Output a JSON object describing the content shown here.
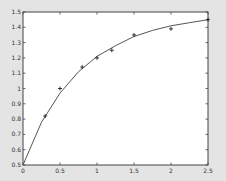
{
  "chart_data": {
    "type": "line",
    "title": "",
    "xlabel": "",
    "ylabel": "",
    "xlim": [
      0,
      2.5
    ],
    "ylim": [
      0.5,
      1.5
    ],
    "grid": false,
    "legend": null,
    "x_ticks": [
      0,
      0.5,
      1,
      1.5,
      2,
      2.5
    ],
    "x_tick_labels": [
      "0",
      "0.5",
      "1",
      "1.5",
      "2",
      "2.5"
    ],
    "y_ticks": [
      0.5,
      0.6,
      0.7,
      0.8,
      0.9,
      1.0,
      1.1,
      1.2,
      1.3,
      1.4,
      1.5
    ],
    "y_tick_labels": [
      "0.5",
      "0.6",
      "0.7",
      "0.8",
      "0.9",
      "1",
      "1.1",
      "1.2",
      "1.3",
      "1.4",
      "1.5"
    ],
    "series": [
      {
        "name": "data",
        "style": "markers",
        "marker": "+",
        "x": [
          0.3,
          0.5,
          0.8,
          1.0,
          1.2,
          1.5,
          2.0,
          2.5
        ],
        "y": [
          0.82,
          1.0,
          1.14,
          1.2,
          1.25,
          1.35,
          1.39,
          1.45
        ]
      },
      {
        "name": "fit",
        "style": "line",
        "x": [
          0,
          0.25,
          0.5,
          0.75,
          1.0,
          1.25,
          1.5,
          1.75,
          2.0,
          2.25,
          2.5
        ],
        "y": [
          0.5,
          0.78,
          0.97,
          1.11,
          1.21,
          1.28,
          1.34,
          1.38,
          1.41,
          1.43,
          1.45
        ]
      }
    ]
  },
  "colors": {
    "background": "#e4e4e4",
    "plot_area": "#ffffff",
    "axis": "#444444",
    "line": "#555555",
    "marker": "#222222"
  }
}
